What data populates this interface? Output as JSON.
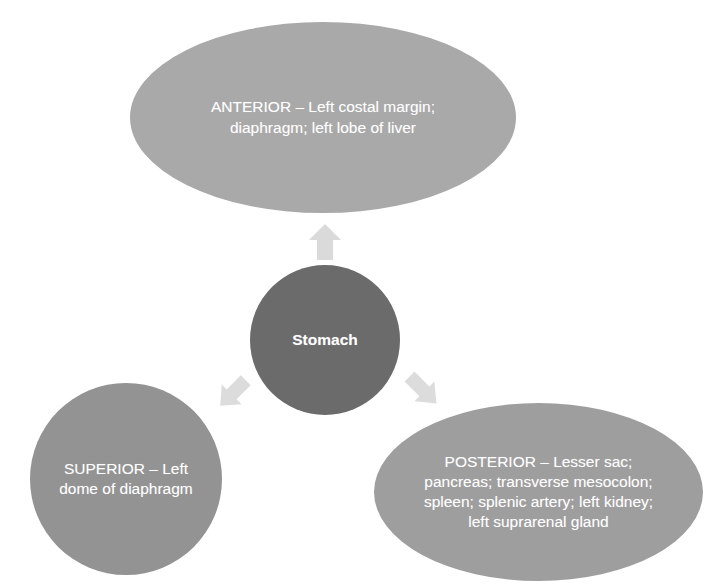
{
  "diagram": {
    "type": "radial-relationship-diagram",
    "colors": {
      "background": "#ffffff",
      "center_node": "#6b6b6b",
      "anterior_node": "#a9a9a9",
      "superior_node": "#939393",
      "posterior_node": "#9e9e9e",
      "arrow": "#d9d9d9",
      "label_text": "#ffffff"
    },
    "center": {
      "label": "Stomach",
      "shape": "circle"
    },
    "nodes": [
      {
        "id": "anterior",
        "shape": "ellipse",
        "heading": "ANTERIOR",
        "label": "ANTERIOR – Left costal margin; diaphragm; left lobe of liver",
        "items": [
          "Left costal margin",
          "diaphragm",
          "left lobe of liver"
        ]
      },
      {
        "id": "superior",
        "shape": "circle",
        "heading": "SUPERIOR",
        "label": "SUPERIOR – Left dome of diaphragm",
        "items": [
          "Left dome of diaphragm"
        ]
      },
      {
        "id": "posterior",
        "shape": "ellipse",
        "heading": "POSTERIOR",
        "label": "POSTERIOR – Lesser sac; pancreas; transverse mesocolon; spleen; splenic artery; left kidney; left suprarenal gland",
        "items": [
          "Lesser sac",
          "pancreas",
          "transverse mesocolon",
          "spleen",
          "splenic artery",
          "left kidney",
          "left suprarenal gland"
        ]
      }
    ],
    "arrows": [
      {
        "id": "arrow-up",
        "from": "stomach",
        "to": "anterior",
        "direction": "up",
        "icon": "block-arrow-up-icon"
      },
      {
        "id": "arrow-left",
        "from": "stomach",
        "to": "superior",
        "direction": "down-left",
        "icon": "block-arrow-down-left-icon"
      },
      {
        "id": "arrow-right",
        "from": "stomach",
        "to": "posterior",
        "direction": "down-right",
        "icon": "block-arrow-down-right-icon"
      }
    ]
  }
}
